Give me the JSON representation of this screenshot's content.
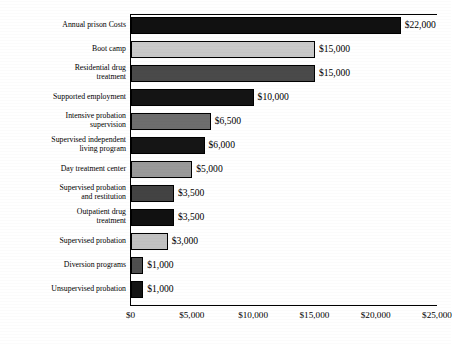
{
  "chart_data": {
    "type": "bar",
    "orientation": "horizontal",
    "title": "",
    "subtitle": "",
    "xlabel": "",
    "ylabel": "",
    "xlim": [
      0,
      25000
    ],
    "xticks": [
      0,
      5000,
      10000,
      15000,
      20000,
      25000
    ],
    "xtick_labels": [
      "$0",
      "$5,000",
      "$10,000",
      "$15,000",
      "$20,000",
      "$25,000"
    ],
    "grid": false,
    "legend": null,
    "categories": [
      "Annual prison Costs",
      "Boot camp",
      "Residential drug treatment",
      "Supported employment",
      "Intensive probation supervision",
      "Supervised independent living program",
      "Day treatment center",
      "Supervised probation and restitution",
      "Outpatient drug treatment",
      "Supervised probation",
      "Diversion programs",
      "Unsupervised probation"
    ],
    "values": [
      22000,
      15000,
      15000,
      10000,
      6500,
      6000,
      5000,
      3500,
      3500,
      3000,
      1000,
      1000
    ],
    "data_labels": [
      "$22,000",
      "$15,000",
      "$15,000",
      "$10,000",
      "$6,500",
      "$6,000",
      "$5,000",
      "$3,500",
      "$3,500",
      "$3,000",
      "$1,000",
      "$1,000"
    ],
    "bar_colors": [
      "#111111",
      "#c9c9c9",
      "#4a4a4a",
      "#141414",
      "#6e6e6e",
      "#151515",
      "#9a9a9a",
      "#434343",
      "#111111",
      "#c2c2c2",
      "#4e4e4e",
      "#141414"
    ]
  },
  "rows": [
    {
      "label_line1": "Annual prison Costs",
      "label_line2": "",
      "value_label": "$22,000"
    },
    {
      "label_line1": "Boot camp",
      "label_line2": "",
      "value_label": "$15,000"
    },
    {
      "label_line1": "Residential drug",
      "label_line2": "treatment",
      "value_label": "$15,000"
    },
    {
      "label_line1": "Supported employment",
      "label_line2": "",
      "value_label": "$10,000"
    },
    {
      "label_line1": "Intensive probation",
      "label_line2": "supervision",
      "value_label": "$6,500"
    },
    {
      "label_line1": "Supervised independent",
      "label_line2": "living program",
      "value_label": "$6,000"
    },
    {
      "label_line1": "Day treatment center",
      "label_line2": "",
      "value_label": "$5,000"
    },
    {
      "label_line1": "Supervised probation",
      "label_line2": "and restitution",
      "value_label": "$3,500"
    },
    {
      "label_line1": "Outpatient drug",
      "label_line2": "treatment",
      "value_label": "$3,500"
    },
    {
      "label_line1": "Supervised probation",
      "label_line2": "",
      "value_label": "$3,000"
    },
    {
      "label_line1": "Diversion programs",
      "label_line2": "",
      "value_label": "$1,000"
    },
    {
      "label_line1": "Unsupervised probation",
      "label_line2": "",
      "value_label": "$1,000"
    }
  ],
  "xaxis": {
    "tick_labels": [
      "$0",
      "$5,000",
      "$10,000",
      "$15,000",
      "$20,000",
      "$25,000"
    ]
  }
}
